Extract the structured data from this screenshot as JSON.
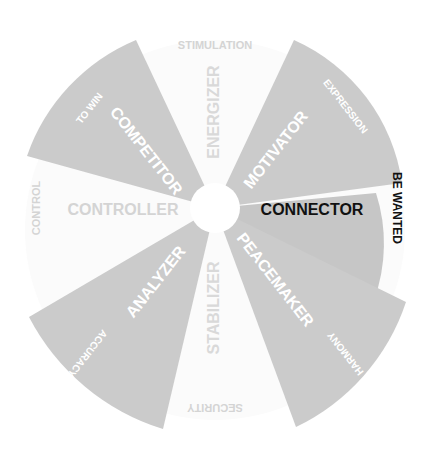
{
  "diagram": {
    "center": {
      "x": 215,
      "y": 208
    },
    "colors": {
      "wedge": "#c9c9c9",
      "connector_wedge": "#c4c4c4",
      "faint_wedge": "#f3f3f3",
      "white_text": "#ffffff",
      "faint_text": "#d6d6d6",
      "dark_text": "#111111",
      "background": "#ffffff"
    },
    "axes": {
      "top": "STIMULATION",
      "bottom": "SECURITY",
      "left": "CONTROL",
      "right": "BE WANTED"
    },
    "styles": [
      {
        "name": "COMPETITOR",
        "drive": "TO WIN",
        "highlighted": false,
        "shaded": true
      },
      {
        "name": "ENERGIZER",
        "drive": "",
        "highlighted": false,
        "shaded": false
      },
      {
        "name": "MOTIVATOR",
        "drive": "EXPRESSION",
        "highlighted": false,
        "shaded": true
      },
      {
        "name": "CONNECTOR",
        "drive": "BE WANTED",
        "highlighted": true,
        "shaded": true
      },
      {
        "name": "PEACEMAKER",
        "drive": "HARMONY",
        "highlighted": false,
        "shaded": true
      },
      {
        "name": "STABILIZER",
        "drive": "",
        "highlighted": false,
        "shaded": false
      },
      {
        "name": "ANALYZER",
        "drive": "ACCURACY",
        "highlighted": false,
        "shaded": true
      },
      {
        "name": "CONTROLLER",
        "drive": "CONTROL",
        "highlighted": false,
        "shaded": false
      }
    ]
  }
}
